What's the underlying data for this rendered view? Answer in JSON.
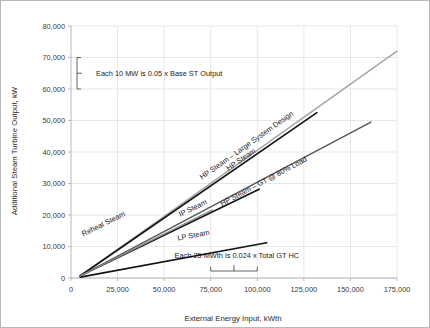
{
  "chart_data": {
    "type": "line",
    "title": "",
    "xlabel": "External Energy Input, kWth",
    "ylabel": "Additional Steam Turbine Output, kW",
    "xlim": [
      0,
      175000
    ],
    "ylim": [
      0,
      80000
    ],
    "xticks": [
      0,
      25000,
      50000,
      75000,
      100000,
      125000,
      150000,
      175000
    ],
    "xtick_labels": [
      "0",
      "25,000",
      "50,000",
      "75,000",
      "100,000",
      "125,000",
      "150,000",
      "175,000"
    ],
    "yticks": [
      0,
      10000,
      20000,
      30000,
      40000,
      50000,
      60000,
      70000,
      80000
    ],
    "ytick_labels": [
      "0",
      "10,000",
      "20,000",
      "30,000",
      "40,000",
      "50,000",
      "60,000",
      "70,000",
      "80,000"
    ],
    "grid": true,
    "legend": "inline-labels",
    "series": [
      {
        "name": "HP Steam – Large System Design",
        "color": "#a6a6a6",
        "width": 1.5,
        "x": [
          5000,
          175000
        ],
        "y": [
          700,
          72000
        ],
        "label_x": 95000,
        "label_y": 41500
      },
      {
        "name": "HP Steam",
        "color": "#141414",
        "width": 1.7,
        "x": [
          5000,
          132000
        ],
        "y": [
          700,
          52500
        ],
        "label_x": 92000,
        "label_y": 37000
      },
      {
        "name": "HP Steam – GT @ 80% Load",
        "color": "#595959",
        "width": 1.5,
        "x": [
          5000,
          161000
        ],
        "y": [
          700,
          49500
        ],
        "label_x": 104000,
        "label_y": 30000
      },
      {
        "name": "IP Steam",
        "color": "#141414",
        "width": 1.7,
        "x": [
          5000,
          101000
        ],
        "y": [
          700,
          28200
        ],
        "label_x": 66000,
        "label_y": 21500
      },
      {
        "name": "LP Steam",
        "color": "#141414",
        "width": 1.7,
        "x": [
          5000,
          105000
        ],
        "y": [
          300,
          11200
        ],
        "label_x": 66000,
        "label_y": 12800
      },
      {
        "name": "Reheat Steam",
        "color": "#8c8c8c",
        "width": 1.4,
        "x": [
          5000,
          76000
        ],
        "y": [
          700,
          21600
        ],
        "label_x": 18000,
        "label_y": 16500
      }
    ],
    "annotations": [
      {
        "text": "Each 10 MW is 0.05 x Base ST Output",
        "kind": "vertical-bracket",
        "bracket_from": 60000,
        "bracket_to": 70000,
        "bracket_at_x": 0,
        "text_x": 7000,
        "text_y": 65000
      },
      {
        "text": "Each 25 MWth is 0.024 x Total GT HC",
        "kind": "horizontal-bracket",
        "bracket_from": 75000,
        "bracket_to": 100000,
        "bracket_at_y": 0,
        "text_x": 89000,
        "text_y": 6200
      }
    ]
  }
}
